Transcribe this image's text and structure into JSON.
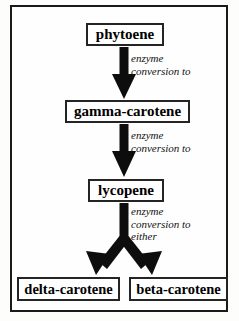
{
  "figure": {
    "background_color": "#fdfdfc",
    "frame_color": "#1a1a1a",
    "ink_color": "#000000"
  },
  "nodes": [
    {
      "id": "phytoene",
      "label": "phytoene"
    },
    {
      "id": "gamma-carotene",
      "label": "gamma-carotene"
    },
    {
      "id": "lycopene",
      "label": "lycopene"
    },
    {
      "id": "delta-carotene",
      "label": "delta-carotene"
    },
    {
      "id": "beta-carotene",
      "label": "beta-carotene"
    }
  ],
  "captions": [
    {
      "id": "caption-1",
      "lines": [
        "enzyme",
        "conversion to"
      ]
    },
    {
      "id": "caption-2",
      "lines": [
        "enzyme",
        "conversion to"
      ]
    },
    {
      "id": "caption-3",
      "lines": [
        "enzyme",
        "conversion to",
        "either"
      ]
    }
  ],
  "caption_text": {
    "c1_l1": "enzyme",
    "c1_l2": "conversion to",
    "c2_l1": "enzyme",
    "c2_l2": "conversion to",
    "c3_l1": "enzyme",
    "c3_l2": "conversion to",
    "c3_l3": "either"
  },
  "arrows": [
    {
      "id": "arrow-phytoene-to-gamma",
      "from": "phytoene",
      "to": "gamma-carotene",
      "shape": "straight-down"
    },
    {
      "id": "arrow-gamma-to-lycopene",
      "from": "gamma-carotene",
      "to": "lycopene",
      "shape": "straight-down"
    },
    {
      "id": "arrow-lycopene-to-delta",
      "from": "lycopene",
      "to": "delta-carotene",
      "shape": "fork-left"
    },
    {
      "id": "arrow-lycopene-to-beta",
      "from": "lycopene",
      "to": "beta-carotene",
      "shape": "fork-right"
    }
  ]
}
